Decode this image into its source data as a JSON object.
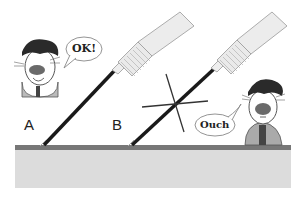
{
  "scene": {
    "labels": {
      "a": "A",
      "b": "B"
    },
    "speech": {
      "left": "OK!",
      "right": "Ouch"
    },
    "colors": {
      "surface_top": "#777777",
      "surface_body": "#dcdcdc",
      "needle": "#1a1a1a",
      "syringe_body": "#e8e8e8",
      "hair": "#2a2a2a",
      "nose": "#6a6a6a"
    }
  }
}
